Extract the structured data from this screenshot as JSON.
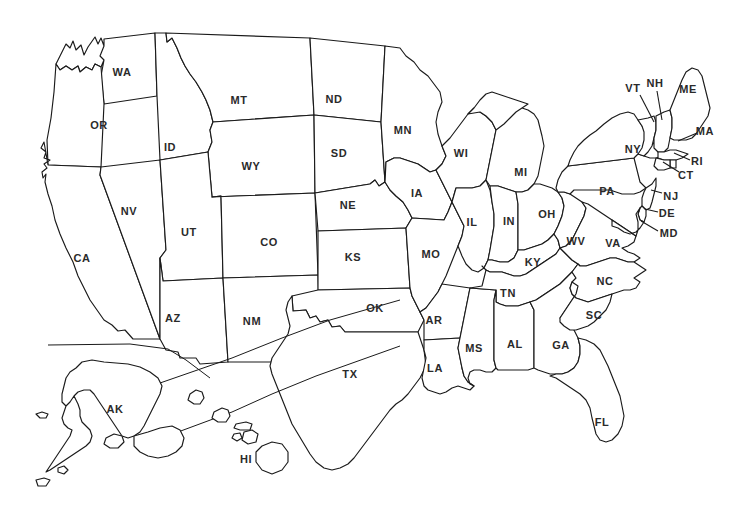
{
  "document": {
    "type": "map",
    "title": "United States Map with State Abbreviations",
    "background_color": "#ffffff",
    "outline_color": "#1a1a1a",
    "label_color": "#2a2a2a"
  },
  "map": {
    "projection_note": "Contiguous United States with Alaska and Hawaii insets below-left, separated by a diagonal divider line",
    "states": [
      {
        "abbr": "WA",
        "name": "Washington",
        "x": 122,
        "y": 72,
        "leader": null
      },
      {
        "abbr": "OR",
        "name": "Oregon",
        "x": 99,
        "y": 125,
        "leader": null
      },
      {
        "abbr": "CA",
        "name": "California",
        "x": 82,
        "y": 258,
        "leader": null
      },
      {
        "abbr": "NV",
        "name": "Nevada",
        "x": 129,
        "y": 211,
        "leader": null
      },
      {
        "abbr": "ID",
        "name": "Idaho",
        "x": 170,
        "y": 147,
        "leader": null
      },
      {
        "abbr": "MT",
        "name": "Montana",
        "x": 239,
        "y": 100,
        "leader": null
      },
      {
        "abbr": "WY",
        "name": "Wyoming",
        "x": 251,
        "y": 166,
        "leader": null
      },
      {
        "abbr": "UT",
        "name": "Utah",
        "x": 189,
        "y": 232,
        "leader": null
      },
      {
        "abbr": "AZ",
        "name": "Arizona",
        "x": 173,
        "y": 318,
        "leader": null
      },
      {
        "abbr": "CO",
        "name": "Colorado",
        "x": 269,
        "y": 242,
        "leader": null
      },
      {
        "abbr": "NM",
        "name": "New Mexico",
        "x": 252,
        "y": 321,
        "leader": null
      },
      {
        "abbr": "ND",
        "name": "North Dakota",
        "x": 334,
        "y": 99,
        "leader": null
      },
      {
        "abbr": "SD",
        "name": "South Dakota",
        "x": 339,
        "y": 153,
        "leader": null
      },
      {
        "abbr": "NE",
        "name": "Nebraska",
        "x": 348,
        "y": 205,
        "leader": null
      },
      {
        "abbr": "KS",
        "name": "Kansas",
        "x": 353,
        "y": 257,
        "leader": null
      },
      {
        "abbr": "OK",
        "name": "Oklahoma",
        "x": 375,
        "y": 308,
        "leader": null
      },
      {
        "abbr": "TX",
        "name": "Texas",
        "x": 350,
        "y": 374,
        "leader": null
      },
      {
        "abbr": "MN",
        "name": "Minnesota",
        "x": 403,
        "y": 130,
        "leader": null
      },
      {
        "abbr": "IA",
        "name": "Iowa",
        "x": 417,
        "y": 193,
        "leader": null
      },
      {
        "abbr": "MO",
        "name": "Missouri",
        "x": 431,
        "y": 254,
        "leader": null
      },
      {
        "abbr": "AR",
        "name": "Arkansas",
        "x": 434,
        "y": 320,
        "leader": null
      },
      {
        "abbr": "LA",
        "name": "Louisiana",
        "x": 435,
        "y": 368,
        "leader": null
      },
      {
        "abbr": "WI",
        "name": "Wisconsin",
        "x": 461,
        "y": 153,
        "leader": null
      },
      {
        "abbr": "IL",
        "name": "Illinois",
        "x": 472,
        "y": 222,
        "leader": null
      },
      {
        "abbr": "MS",
        "name": "Mississippi",
        "x": 474,
        "y": 348,
        "leader": null
      },
      {
        "abbr": "MI",
        "name": "Michigan",
        "x": 521,
        "y": 172,
        "leader": null
      },
      {
        "abbr": "IN",
        "name": "Indiana",
        "x": 509,
        "y": 221,
        "leader": null
      },
      {
        "abbr": "KY",
        "name": "Kentucky",
        "x": 533,
        "y": 262,
        "leader": null
      },
      {
        "abbr": "TN",
        "name": "Tennessee",
        "x": 508,
        "y": 293,
        "leader": null
      },
      {
        "abbr": "AL",
        "name": "Alabama",
        "x": 515,
        "y": 344,
        "leader": null
      },
      {
        "abbr": "OH",
        "name": "Ohio",
        "x": 547,
        "y": 214,
        "leader": null
      },
      {
        "abbr": "GA",
        "name": "Georgia",
        "x": 561,
        "y": 345,
        "leader": null
      },
      {
        "abbr": "WV",
        "name": "West Virginia",
        "x": 576,
        "y": 241,
        "leader": null
      },
      {
        "abbr": "FL",
        "name": "Florida",
        "x": 602,
        "y": 422,
        "leader": null
      },
      {
        "abbr": "VA",
        "name": "Virginia",
        "x": 613,
        "y": 243,
        "leader": null
      },
      {
        "abbr": "NC",
        "name": "North Carolina",
        "x": 605,
        "y": 281,
        "leader": null
      },
      {
        "abbr": "SC",
        "name": "South Carolina",
        "x": 594,
        "y": 315,
        "leader": null
      },
      {
        "abbr": "PA",
        "name": "Pennsylvania",
        "x": 607,
        "y": 191,
        "leader": null
      },
      {
        "abbr": "NY",
        "name": "New York",
        "x": 633,
        "y": 149,
        "leader": null
      },
      {
        "abbr": "VT",
        "name": "Vermont",
        "x": 633,
        "y": 88,
        "leader": [
          640,
          95,
          654,
          122
        ]
      },
      {
        "abbr": "NH",
        "name": "New Hampshire",
        "x": 655,
        "y": 83,
        "leader": [
          657,
          91,
          662,
          120
        ]
      },
      {
        "abbr": "ME",
        "name": "Maine",
        "x": 688,
        "y": 89,
        "leader": null
      },
      {
        "abbr": "MA",
        "name": "Massachusetts",
        "x": 705,
        "y": 131,
        "leader": [
          697,
          133,
          678,
          141
        ]
      },
      {
        "abbr": "RI",
        "name": "Rhode Island",
        "x": 697,
        "y": 161,
        "leader": [
          690,
          160,
          674,
          153
        ]
      },
      {
        "abbr": "CT",
        "name": "Connecticut",
        "x": 686,
        "y": 175,
        "leader": [
          679,
          172,
          663,
          162
        ]
      },
      {
        "abbr": "NJ",
        "name": "New Jersey",
        "x": 671,
        "y": 196,
        "leader": [
          662,
          193,
          651,
          190
        ]
      },
      {
        "abbr": "DE",
        "name": "Delaware",
        "x": 667,
        "y": 213,
        "leader": [
          658,
          212,
          645,
          209
        ]
      },
      {
        "abbr": "MD",
        "name": "Maryland",
        "x": 669,
        "y": 233,
        "leader": [
          658,
          231,
          641,
          221
        ]
      },
      {
        "abbr": "AK",
        "name": "Alaska",
        "x": 115,
        "y": 409,
        "leader": null
      },
      {
        "abbr": "HI",
        "name": "Hawaii",
        "x": 246,
        "y": 459,
        "leader": null
      }
    ]
  },
  "insets": {
    "alaska_label": "AK",
    "hawaii_label": "HI",
    "divider_description": "Straight horizontal-to-diagonal rules separating the Alaska and Hawaii insets from the contiguous states"
  }
}
